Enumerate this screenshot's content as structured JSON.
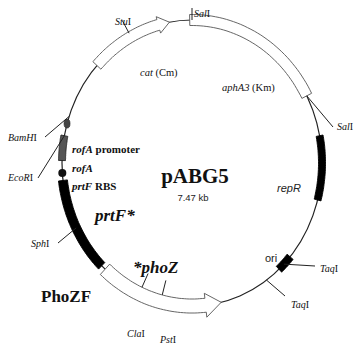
{
  "plasmid": {
    "name": "pABG5",
    "size": "7.47 kb",
    "construct_label": "PhoZF"
  },
  "features": {
    "cat": {
      "gene": "cat",
      "marker": " (Cm)"
    },
    "aphA3": {
      "gene": "aphA3",
      "marker": " (Km)"
    },
    "repR": {
      "label": "repR"
    },
    "ori": {
      "label": "ori"
    },
    "phoZ": {
      "label": "*phoZ"
    },
    "prtF": {
      "label": "prtF*"
    },
    "prtF_rbs": {
      "gene": "prtF",
      "suffix": " RBS"
    },
    "rofA": {
      "label": "rofA"
    },
    "rofA_promoter": {
      "gene": "rofA",
      "suffix": " promoter"
    }
  },
  "sites": {
    "stuI": {
      "name": "Stu",
      "suffix": "I"
    },
    "salI_top": {
      "name": "Sal",
      "suffix": "I"
    },
    "salI_right": {
      "name": "Sal",
      "suffix": "I"
    },
    "taqI_upper": {
      "name": "Taq",
      "suffix": "I"
    },
    "taqI_lower": {
      "name": "Taq",
      "suffix": "I"
    },
    "pstI": {
      "name": "Pst",
      "suffix": "I"
    },
    "claI": {
      "name": "Cla",
      "suffix": "I"
    },
    "sphI": {
      "name": "Sph",
      "suffix": "I"
    },
    "ecoRI": {
      "name": "EcoR",
      "suffix": "I"
    },
    "bamHI": {
      "name": "BamH",
      "suffix": "I"
    }
  },
  "colors": {
    "backbone": "#222222",
    "solid_feature": "#000000",
    "rofA_fill": "#555555",
    "arrow_outline": "#555555"
  }
}
